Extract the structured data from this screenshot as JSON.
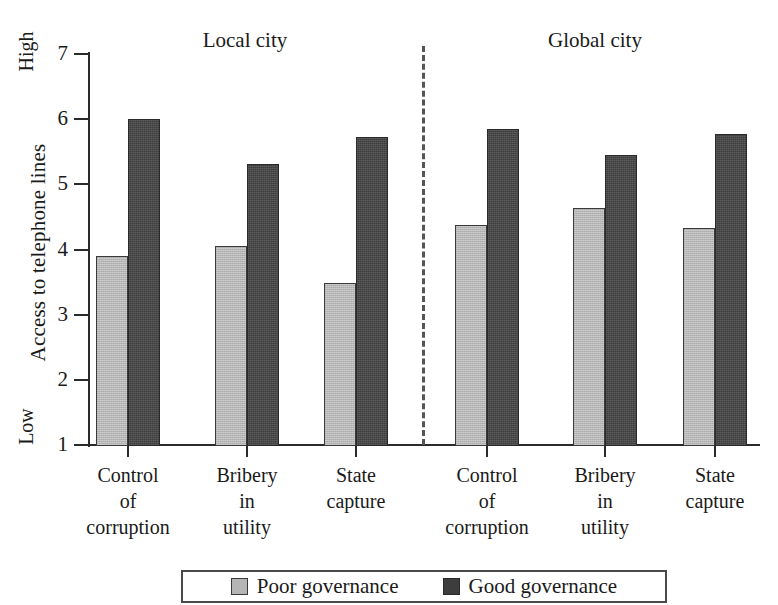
{
  "chart_data": {
    "type": "bar",
    "title": "",
    "xlabel": "",
    "ylabel": "Access to telephone lines",
    "ylim": [
      1,
      7
    ],
    "yticks": [
      1,
      2,
      3,
      4,
      5,
      6,
      7
    ],
    "ytick_labels": [
      "1",
      "2",
      "3",
      "4",
      "5",
      "6",
      "7"
    ],
    "y_axis_high_label": "High",
    "y_axis_low_label": "Low",
    "grid": false,
    "legend_position": "bottom",
    "panels": [
      {
        "name": "Local city",
        "categories": [
          "Control\nof\ncorruption",
          "Bribery\nin\nutility",
          "State\ncapture"
        ]
      },
      {
        "name": "Global city",
        "categories": [
          "Control\nof\ncorruption",
          "Bribery\nin\nutility",
          "State\ncapture"
        ]
      }
    ],
    "categories": [
      "Control of corruption (Local city)",
      "Bribery in utility (Local city)",
      "State capture (Local city)",
      "Control of corruption (Global city)",
      "Bribery in utility (Global city)",
      "State capture (Global city)"
    ],
    "series": [
      {
        "name": "Poor governance",
        "color": "#b5b5b5",
        "values": [
          3.9,
          4.05,
          3.48,
          4.37,
          4.63,
          4.33
        ]
      },
      {
        "name": "Good governance",
        "color": "#3d3d3d",
        "values": [
          6.0,
          5.31,
          5.73,
          5.85,
          5.45,
          5.78
        ]
      }
    ]
  },
  "axis": {
    "ytick_1": "1",
    "ytick_2": "2",
    "ytick_3": "3",
    "ytick_4": "4",
    "ytick_5": "5",
    "ytick_6": "6",
    "ytick_7": "7",
    "y_title": "Access to telephone lines",
    "high": "High",
    "low": "Low"
  },
  "panels": {
    "left_title": "Local city",
    "right_title": "Global city"
  },
  "categories": {
    "c0": "Control\nof\ncorruption",
    "c1": "Bribery\nin\nutility",
    "c2": "State\ncapture",
    "c3": "Control\nof\ncorruption",
    "c4": "Bribery\nin\nutility",
    "c5": "State\ncapture"
  },
  "legend": {
    "poor_label": "Poor governance",
    "good_label": "Good governance"
  }
}
